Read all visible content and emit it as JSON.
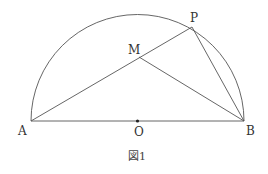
{
  "figure": {
    "caption": "図1",
    "points": {
      "A": {
        "label": "A",
        "x": 31,
        "y": 121
      },
      "B": {
        "label": "B",
        "x": 244,
        "y": 121
      },
      "O": {
        "label": "O",
        "x": 137.5,
        "y": 121
      },
      "P": {
        "label": "P",
        "x": 192,
        "y": 27
      },
      "M": {
        "label": "M",
        "x": 139,
        "y": 57
      }
    },
    "segments": [
      "AB",
      "AP",
      "PB",
      "MB"
    ],
    "arc": "semicircle with diameter AB, center O"
  }
}
